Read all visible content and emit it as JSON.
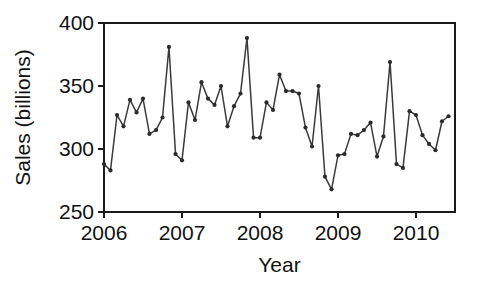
{
  "chart_data": {
    "type": "line",
    "title": "",
    "xlabel": "Year",
    "ylabel": "Sales (billions)",
    "xlim": [
      2006.0,
      2010.5
    ],
    "ylim": [
      250,
      400
    ],
    "yticks": [
      250,
      300,
      350,
      400
    ],
    "ytick_labels": [
      "250",
      "300",
      "350",
      "400"
    ],
    "xticks": [
      2006,
      2007,
      2008,
      2009,
      2010
    ],
    "xtick_labels": [
      "2006",
      "2007",
      "2008",
      "2009",
      "2010"
    ],
    "grid": false,
    "legend": null,
    "marker": "circle",
    "line_color": "#3a3a3a",
    "marker_color": "#2b2b2b",
    "axis_color": "#1a1a1a",
    "background_color": "#ffffff",
    "series": [
      {
        "name": "Sales",
        "x": [
          2006.0,
          2006.083,
          2006.167,
          2006.25,
          2006.333,
          2006.417,
          2006.5,
          2006.583,
          2006.667,
          2006.75,
          2006.833,
          2006.917,
          2007.0,
          2007.083,
          2007.167,
          2007.25,
          2007.333,
          2007.417,
          2007.5,
          2007.583,
          2007.667,
          2007.75,
          2007.833,
          2007.917,
          2008.0,
          2008.083,
          2008.167,
          2008.25,
          2008.333,
          2008.417,
          2008.5,
          2008.583,
          2008.667,
          2008.75,
          2008.833,
          2008.917,
          2009.0,
          2009.083,
          2009.167,
          2009.25,
          2009.333,
          2009.417,
          2009.5,
          2009.583,
          2009.667,
          2009.75,
          2009.833,
          2009.917,
          2010.0,
          2010.083,
          2010.167,
          2010.25,
          2010.333,
          2010.417
        ],
        "values": [
          288,
          283,
          327,
          318,
          339,
          329,
          340,
          312,
          315,
          325,
          381,
          296,
          291,
          337,
          323,
          353,
          340,
          335,
          350,
          318,
          334,
          344,
          388,
          309,
          309,
          337,
          331,
          359,
          346,
          346,
          344,
          317,
          302,
          350,
          278,
          268,
          295,
          296,
          312,
          311,
          315,
          321,
          294,
          310,
          369,
          288,
          285,
          330,
          327,
          311,
          304,
          299,
          322,
          326
        ]
      }
    ]
  },
  "axes": {
    "x_title": "Year",
    "y_title": "Sales (billions)"
  }
}
